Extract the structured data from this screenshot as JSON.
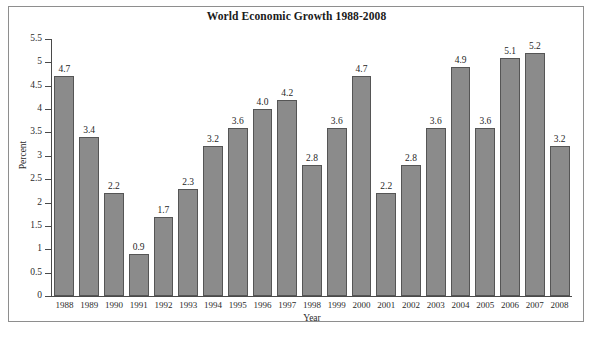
{
  "chart_data": {
    "type": "bar",
    "title": "World Economic Growth 1988-2008",
    "xlabel": "Year",
    "ylabel": "Percent",
    "categories": [
      "1988",
      "1989",
      "1990",
      "1991",
      "1992",
      "1993",
      "1994",
      "1995",
      "1996",
      "1997",
      "1998",
      "1999",
      "2000",
      "2001",
      "2002",
      "2003",
      "2004",
      "2005",
      "2006",
      "2007",
      "2008"
    ],
    "values": [
      4.7,
      3.4,
      2.2,
      0.9,
      1.7,
      2.3,
      3.2,
      3.6,
      4.0,
      4.2,
      2.8,
      3.6,
      4.7,
      2.2,
      2.8,
      3.6,
      4.9,
      3.6,
      5.1,
      5.2,
      3.2
    ],
    "value_labels": [
      "4.7",
      "3.4",
      "2.2",
      "0.9",
      "1.7",
      "2.3",
      "3.2",
      "3.6",
      "4.0",
      "4.2",
      "2.8",
      "3.6",
      "4.7",
      "2.2",
      "2.8",
      "3.6",
      "4.9",
      "3.6",
      "5.1",
      "5.2",
      "3.2"
    ],
    "ylim": [
      0,
      5.5
    ],
    "ytick_values": [
      0,
      0.5,
      1,
      1.5,
      2,
      2.5,
      3,
      3.5,
      4,
      4.5,
      5,
      5.5
    ],
    "ytick_labels": [
      "0",
      "0.5",
      "1",
      "1.5",
      "2",
      "2.5",
      "3",
      "3.5",
      "4",
      "4.5",
      "5",
      "5.5"
    ],
    "grid": false,
    "legend": false,
    "bar_color": "#8b8b8b",
    "bar_border_color": "#555555",
    "axis_color": "#4a4a4a",
    "frame_color": "#8e8e8e",
    "text_color": "#1f1f1f"
  }
}
